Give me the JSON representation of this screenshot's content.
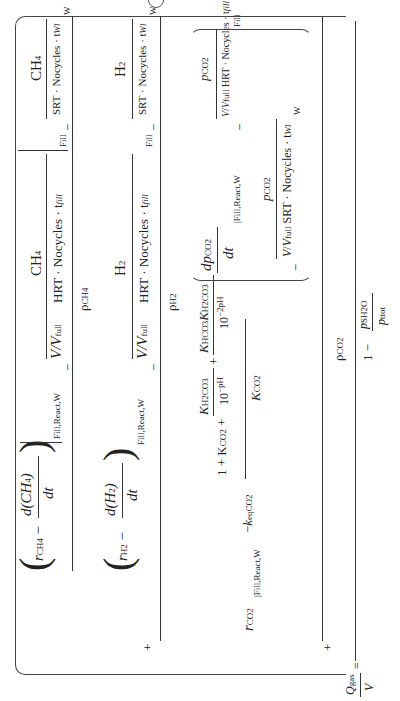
{
  "equation": {
    "lhs": {
      "numerator": "Q",
      "numerator_sub": "gas",
      "denominator": "V",
      "equals": "="
    },
    "outer_denominator": {
      "one": "1",
      "minus": "−",
      "num": "p",
      "num_sub": "SH2O",
      "den": "p",
      "den_sub": "ttot"
    },
    "ch4_term": {
      "rate": "r",
      "rate_sub": "CH4",
      "minus": "−",
      "deriv_num": "d(CH",
      "deriv_num_sub": "4",
      "deriv_num_close": ")",
      "deriv_den": "dt",
      "eval_sub": "Fill,React,W",
      "fill_num": "CH",
      "fill_num_sub": "4",
      "fill_den": "HRT · Nocycles · t",
      "fill_den_sub": "fill",
      "fill_eval": "Fill",
      "w_num": "CH",
      "w_num_sub": "4",
      "w_den": "SRT · Nocycles · t",
      "w_den_sub": "Wl",
      "w_eval": "W",
      "vv": "V",
      "vfull": "V",
      "vfull_sub": "full",
      "density": "ρ",
      "density_sub": "CH4"
    },
    "h2_term": {
      "rate": "r",
      "rate_sub": "H2",
      "minus": "−",
      "deriv_num": "d(H",
      "deriv_num_sub": "2",
      "deriv_num_close": ")",
      "deriv_den": "dt",
      "eval_sub": "Fill,React,W",
      "fill_num": "H",
      "fill_num_sub": "2",
      "fill_den": "HRT · Nocycles · t",
      "fill_den_sub": "fill",
      "fill_eval": "Fill",
      "w_num": "H",
      "w_num_sub": "2",
      "w_den": "SRT · Nocycles · t",
      "w_den_sub": "Wl",
      "w_eval": "W",
      "vv": "V",
      "vfull": "V",
      "vfull_sub": "full",
      "density": "ρ",
      "density_sub": "H2",
      "plus": "+"
    },
    "co2_term": {
      "rate": "r",
      "rate_sub": "CO2",
      "eval_sub": "Fill,React,W",
      "minus": "−",
      "keq": "k",
      "keq_sub": "eqCO2",
      "den_one": "1 + K",
      "den_one_sub": "CO2",
      "plus": "+",
      "frac1_num": "K",
      "frac1_num_sub": "H2CO3",
      "frac1_den": "10",
      "frac1_den_sup": "−pH",
      "frac2_num_a": "K",
      "frac2_num_a_sub": "HCO3",
      "frac2_num_b": "K",
      "frac2_num_b_sub": "H2CO3",
      "frac2_den": "10",
      "frac2_den_sup": "−2pH",
      "den_k": "K",
      "den_k_sub": "CO2",
      "deriv_num": "dp",
      "deriv_num_sub": "CO2",
      "deriv_den": "dt",
      "fill_num": "p",
      "fill_num_sub": "CO2",
      "fill_den": "HRT · Nocycles · t",
      "fill_den_sub": "fill",
      "fill_eval": "Fill",
      "w_num": "p",
      "w_num_sub": "CO2",
      "w_den": "SRT · Nocycles · t",
      "w_den_sub": "Wl",
      "w_eval": "W",
      "vv": "V",
      "vfull": "V",
      "vfull_sub": "full",
      "density": "ρ",
      "density_sub": "CO2"
    }
  }
}
